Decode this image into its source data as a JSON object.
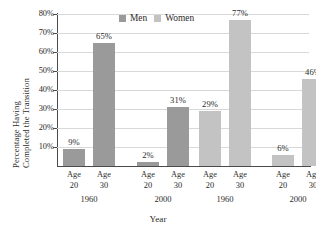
{
  "chart_data": {
    "type": "bar",
    "title": "",
    "xlabel": "Year",
    "ylabel_line1": "Percentage Having",
    "ylabel_line2": "Completed the Transition",
    "ylim": [
      0,
      80
    ],
    "ytick_labels": [
      "80%",
      "70%",
      "60%",
      "50%",
      "40%",
      "30%",
      "20%",
      "10%"
    ],
    "ytick_values": [
      80,
      70,
      60,
      50,
      40,
      30,
      20,
      10
    ],
    "grid": true,
    "legend_position": "top-center",
    "legend": [
      {
        "name": "Men",
        "color": "#9a9a9a"
      },
      {
        "name": "Women",
        "color": "#c3c3c3"
      }
    ],
    "categories": [
      "Age 20",
      "Age 30",
      "Age 20",
      "Age 30",
      "Age 20",
      "Age 30",
      "Age 20",
      "Age 30"
    ],
    "group_labels": [
      "1960",
      "2000",
      "1960",
      "2000"
    ],
    "bars": [
      {
        "series": "Men",
        "group": "1960",
        "age": "Age",
        "age_number": "20",
        "value": 9,
        "label": "9%"
      },
      {
        "series": "Men",
        "group": "1960",
        "age": "Age",
        "age_number": "30",
        "value": 65,
        "label": "65%"
      },
      {
        "series": "Men",
        "group": "2000",
        "age": "Age",
        "age_number": "20",
        "value": 2,
        "label": "2%"
      },
      {
        "series": "Men",
        "group": "2000",
        "age": "Age",
        "age_number": "30",
        "value": 31,
        "label": "31%"
      },
      {
        "series": "Women",
        "group": "1960",
        "age": "Age",
        "age_number": "20",
        "value": 29,
        "label": "29%"
      },
      {
        "series": "Women",
        "group": "1960",
        "age": "Age",
        "age_number": "30",
        "value": 77,
        "label": "77%"
      },
      {
        "series": "Women",
        "group": "2000",
        "age": "Age",
        "age_number": "20",
        "value": 6,
        "label": "6%"
      },
      {
        "series": "Women",
        "group": "2000",
        "age": "Age",
        "age_number": "30",
        "value": 46,
        "label": "46%"
      }
    ],
    "colors": {
      "men": "#9a9a9a",
      "women": "#c3c3c3",
      "axis": "#4a4a4a",
      "grid": "#d8d8d8",
      "text": "#2b2b2b",
      "background": "#ffffff"
    }
  }
}
